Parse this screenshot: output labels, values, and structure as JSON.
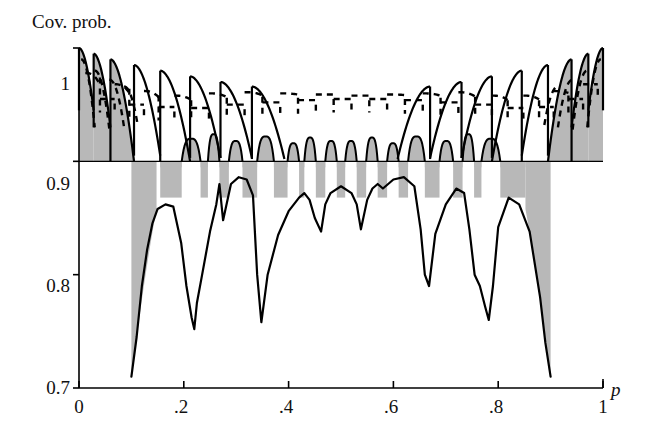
{
  "chart_data": {
    "type": "line",
    "title": "Cov. prob.",
    "xlabel": "p",
    "ylabel": "Cov. prob.",
    "xlim": [
      0,
      1
    ],
    "ylim": [
      0.7,
      1.0
    ],
    "grid": false,
    "legend": "none",
    "xticks": [
      0,
      0.2,
      0.4,
      0.6,
      0.8,
      1
    ],
    "xticklabels": [
      "0",
      ".2",
      ".4",
      ".6",
      ".8",
      "1"
    ],
    "yticks": [
      0.7,
      0.8,
      0.9,
      1.0
    ],
    "yticklabels": [
      "0.7",
      "0.8",
      "0.9",
      "1"
    ],
    "reference_lines": [
      {
        "name": "nominal-level",
        "orientation": "horizontal",
        "value": 0.9,
        "style": "solid"
      }
    ],
    "shading": {
      "name": "coverage-deficit-band",
      "color": "#b8b8b8",
      "description": "gray region between upper oscillating coverage envelope and the lower coverage envelope"
    },
    "series": [
      {
        "name": "solid-envelope-upper",
        "style": "solid",
        "color": "#000000",
        "description": "sawtooth coverage of the standard interval, descending peaks from 1 near the edges",
        "x": [
          0.0,
          0.008,
          0.016,
          0.022,
          0.03,
          0.038,
          0.046,
          0.052,
          0.06,
          0.068,
          0.076,
          0.082,
          0.09,
          0.098,
          0.105,
          0.112,
          0.12,
          0.128,
          0.134,
          0.14,
          0.148,
          0.156,
          0.164,
          0.172,
          0.18,
          0.19,
          0.2,
          0.21,
          0.22,
          0.23,
          0.24,
          0.25,
          0.262,
          0.275,
          0.29,
          0.305,
          0.32,
          0.335,
          0.35,
          0.365,
          0.38,
          0.395,
          0.41,
          0.425,
          0.44,
          0.455,
          0.47,
          0.485,
          0.5,
          0.515,
          0.53,
          0.545,
          0.56,
          0.575,
          0.59,
          0.605,
          0.62,
          0.635,
          0.65,
          0.665,
          0.68,
          0.695,
          0.71,
          0.725,
          0.74,
          0.755,
          0.77,
          0.785,
          0.795,
          0.81,
          0.82,
          0.83,
          0.84,
          0.85,
          0.86,
          0.87,
          0.88,
          0.89,
          0.9,
          0.91,
          0.92,
          0.93,
          0.94,
          0.95,
          0.96,
          0.97,
          0.978,
          0.986,
          0.992,
          1.0
        ],
        "y": [
          1.0,
          0.996,
          0.99,
          0.983,
          0.975,
          0.968,
          0.96,
          0.952,
          0.944,
          0.938,
          0.931,
          0.925,
          0.919,
          0.913,
          0.908,
          0.903,
          0.9,
          0.899,
          0.9,
          0.901,
          0.903,
          0.906,
          0.909,
          0.912,
          0.915,
          0.918,
          0.921,
          0.922,
          0.923,
          0.924,
          0.924,
          0.923,
          0.922,
          0.921,
          0.92,
          0.919,
          0.918,
          0.918,
          0.917,
          0.917,
          0.917,
          0.917,
          0.917,
          0.917,
          0.917,
          0.917,
          0.917,
          0.917,
          0.917,
          0.917,
          0.917,
          0.917,
          0.917,
          0.917,
          0.917,
          0.917,
          0.918,
          0.918,
          0.918,
          0.919,
          0.92,
          0.921,
          0.922,
          0.923,
          0.924,
          0.924,
          0.923,
          0.921,
          0.918,
          0.915,
          0.912,
          0.909,
          0.906,
          0.903,
          0.901,
          0.9,
          0.899,
          0.9,
          0.903,
          0.908,
          0.913,
          0.919,
          0.925,
          0.931,
          0.938,
          0.944,
          0.952,
          0.968,
          0.983,
          1.0
        ]
      },
      {
        "name": "dashed-envelope",
        "style": "dashed",
        "color": "#000000",
        "description": "coverage of an alternative (adjusted) interval, plateaus around 0.95-0.96 across the interior",
        "x": [
          0.0,
          0.02,
          0.04,
          0.06,
          0.08,
          0.1,
          0.12,
          0.14,
          0.16,
          0.18,
          0.2,
          0.22,
          0.24,
          0.26,
          0.28,
          0.3,
          0.32,
          0.34,
          0.36,
          0.38,
          0.4,
          0.42,
          0.44,
          0.46,
          0.48,
          0.5,
          0.52,
          0.54,
          0.56,
          0.58,
          0.6,
          0.62,
          0.64,
          0.66,
          0.68,
          0.7,
          0.72,
          0.74,
          0.76,
          0.78,
          0.8,
          0.82,
          0.84,
          0.86,
          0.88,
          0.9,
          0.92,
          0.94,
          0.96,
          0.98,
          1.0
        ],
        "y": [
          0.985,
          0.966,
          0.955,
          0.962,
          0.95,
          0.958,
          0.948,
          0.955,
          0.946,
          0.956,
          0.949,
          0.958,
          0.95,
          0.959,
          0.952,
          0.96,
          0.953,
          0.961,
          0.954,
          0.96,
          0.955,
          0.96,
          0.956,
          0.959,
          0.956,
          0.958,
          0.956,
          0.959,
          0.956,
          0.96,
          0.955,
          0.96,
          0.954,
          0.961,
          0.953,
          0.96,
          0.952,
          0.959,
          0.95,
          0.958,
          0.949,
          0.956,
          0.946,
          0.955,
          0.948,
          0.958,
          0.95,
          0.962,
          0.955,
          0.966,
          0.985
        ]
      },
      {
        "name": "solid-envelope-lower",
        "style": "solid",
        "color": "#000000",
        "description": "lower coverage envelope with deep downward spikes, minimum near 0.71 at p=0.10 and p=0.90",
        "x": [
          0.1,
          0.11,
          0.12,
          0.13,
          0.14,
          0.15,
          0.165,
          0.18,
          0.195,
          0.205,
          0.215,
          0.22,
          0.225,
          0.235,
          0.25,
          0.262,
          0.268,
          0.275,
          0.29,
          0.305,
          0.32,
          0.332,
          0.34,
          0.348,
          0.36,
          0.38,
          0.4,
          0.42,
          0.43,
          0.44,
          0.45,
          0.462,
          0.47,
          0.48,
          0.5,
          0.52,
          0.53,
          0.538,
          0.55,
          0.56,
          0.57,
          0.58,
          0.6,
          0.62,
          0.64,
          0.652,
          0.66,
          0.668,
          0.68,
          0.7,
          0.72,
          0.735,
          0.745,
          0.755,
          0.765,
          0.775,
          0.782,
          0.79,
          0.8,
          0.82,
          0.84,
          0.86,
          0.88,
          0.89,
          0.9
        ],
        "y": [
          0.71,
          0.745,
          0.79,
          0.822,
          0.845,
          0.858,
          0.862,
          0.86,
          0.828,
          0.79,
          0.762,
          0.752,
          0.775,
          0.8,
          0.838,
          0.862,
          0.88,
          0.848,
          0.88,
          0.886,
          0.884,
          0.87,
          0.8,
          0.758,
          0.8,
          0.835,
          0.856,
          0.868,
          0.872,
          0.866,
          0.85,
          0.838,
          0.862,
          0.872,
          0.878,
          0.872,
          0.862,
          0.84,
          0.866,
          0.876,
          0.88,
          0.876,
          0.884,
          0.886,
          0.878,
          0.84,
          0.8,
          0.79,
          0.836,
          0.862,
          0.876,
          0.872,
          0.84,
          0.8,
          0.79,
          0.772,
          0.76,
          0.79,
          0.842,
          0.868,
          0.862,
          0.838,
          0.78,
          0.74,
          0.71
        ]
      }
    ]
  },
  "axis": {
    "title_label": "Cov. prob.",
    "p_label": "p",
    "yticklabels": [
      "1",
      "0.9",
      "0.8",
      "0.7"
    ],
    "xticklabels": [
      "0",
      ".2",
      ".4",
      ".6",
      ".8",
      "1"
    ]
  }
}
